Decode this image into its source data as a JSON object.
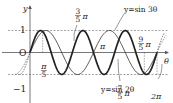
{
  "chart_data": {
    "type": "line",
    "title": "",
    "xlabel": "θ",
    "ylabel": "y",
    "xlim_rad": [
      0,
      6.283185307
    ],
    "ylim": [
      -1,
      1
    ],
    "origin_label": "O",
    "y_ticks": [
      {
        "value": 1,
        "label": "1"
      },
      {
        "value": -1,
        "label": "-1"
      }
    ],
    "x_annotations": [
      {
        "value_over_pi": 0.2,
        "num": "π",
        "den": "5",
        "suffix": ""
      },
      {
        "value_over_pi": 0.6,
        "num": "3",
        "den": "5",
        "suffix": "π"
      },
      {
        "value_over_pi": 1.0,
        "num": "",
        "den": "",
        "suffix": "π"
      },
      {
        "value_over_pi": 1.4,
        "num": "7",
        "den": "5",
        "suffix": "π"
      },
      {
        "value_over_pi": 1.8,
        "num": "9",
        "den": "5",
        "suffix": "π"
      },
      {
        "value_over_pi": 2.0,
        "num": "",
        "den": "",
        "suffix": "2π"
      }
    ],
    "series": [
      {
        "name": "y=sin 2θ",
        "function": "sin(2θ)",
        "style": "thin"
      },
      {
        "name": "y=sin 3θ",
        "function": "sin(3θ)",
        "style": "thick"
      }
    ],
    "labels": {
      "sin2": "y=sin 2θ",
      "sin3": "y=sin 3θ",
      "axis_x": "θ",
      "axis_y": "y",
      "origin": "O",
      "one": "1",
      "minus_one": "−1",
      "pi": "π",
      "two_pi": "2π"
    },
    "colors": {
      "curve": "#222222",
      "axis": "#555555",
      "dashed": "#666666"
    }
  }
}
